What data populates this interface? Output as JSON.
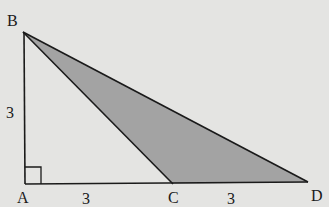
{
  "diagram": {
    "type": "geometry",
    "points": {
      "A": {
        "label": "A",
        "x": 25,
        "y": 184
      },
      "B": {
        "label": "B",
        "x": 23,
        "y": 32
      },
      "C": {
        "label": "C",
        "x": 173,
        "y": 184
      },
      "D": {
        "label": "D",
        "x": 308,
        "y": 182
      }
    },
    "segments": [
      {
        "from": "A",
        "to": "B",
        "label": "3"
      },
      {
        "from": "A",
        "to": "C",
        "label": "3"
      },
      {
        "from": "C",
        "to": "D",
        "label": "3"
      },
      {
        "from": "B",
        "to": "C",
        "label": ""
      },
      {
        "from": "B",
        "to": "D",
        "label": ""
      }
    ],
    "shaded_region": [
      "B",
      "C",
      "D"
    ],
    "right_angle_at": "A",
    "colors": {
      "background": "#e4e4e2",
      "shade": "#a3a3a3",
      "stroke": "#1a1a1a"
    },
    "labels": {
      "A": "A",
      "B": "B",
      "C": "C",
      "D": "D",
      "AB": "3",
      "AC": "3",
      "CD": "3"
    }
  }
}
